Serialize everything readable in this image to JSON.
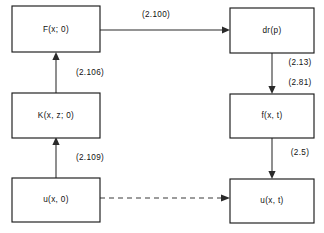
{
  "diagram": {
    "type": "flow-diagram",
    "background_color": "#ffffff",
    "stroke_color": "#1a1a1a",
    "text_color": "#111111",
    "nodes": [
      {
        "id": "F_x_0",
        "label": "F(x; 0)",
        "column": "left",
        "row": "top"
      },
      {
        "id": "K_xz_0",
        "label": "K(x, z; 0)",
        "column": "left",
        "row": "middle"
      },
      {
        "id": "u_x_0",
        "label": "u(x, 0)",
        "column": "left",
        "row": "bottom"
      },
      {
        "id": "dr_p",
        "label": "dr(p)",
        "column": "right",
        "row": "top"
      },
      {
        "id": "f_x_t",
        "label": "f(x, t)",
        "column": "right",
        "row": "middle"
      },
      {
        "id": "u_x_t",
        "label": "u(x, t)",
        "column": "right",
        "row": "bottom"
      }
    ],
    "edges": [
      {
        "id": "e_F_to_dr",
        "from": "F_x_0",
        "to": "dr_p",
        "style": "solid",
        "direction": "right",
        "labels": [
          "(2.100)"
        ]
      },
      {
        "id": "e_K_to_F",
        "from": "K_xz_0",
        "to": "F_x_0",
        "style": "solid",
        "direction": "up",
        "labels": [
          "(2.106)"
        ]
      },
      {
        "id": "e_u_to_K",
        "from": "u_x_0",
        "to": "K_xz_0",
        "style": "solid",
        "direction": "up",
        "labels": [
          "(2.109)"
        ]
      },
      {
        "id": "e_dr_to_f",
        "from": "dr_p",
        "to": "f_x_t",
        "style": "solid",
        "direction": "down",
        "labels": [
          "(2.13)",
          "(2.81)"
        ]
      },
      {
        "id": "e_f_to_u",
        "from": "f_x_t",
        "to": "u_x_t",
        "style": "solid",
        "direction": "down",
        "labels": [
          "(2.5)"
        ]
      },
      {
        "id": "e_u0_to_ut",
        "from": "u_x_0",
        "to": "u_x_t",
        "style": "dashed",
        "direction": "right",
        "labels": []
      }
    ],
    "edge_labels": {
      "top_horizontal": "(2.100)",
      "left_upper": "(2.106)",
      "left_lower": "(2.109)",
      "right_upper_a": "(2.13)",
      "right_upper_b": "(2.81)",
      "right_lower": "(2.5)"
    }
  }
}
